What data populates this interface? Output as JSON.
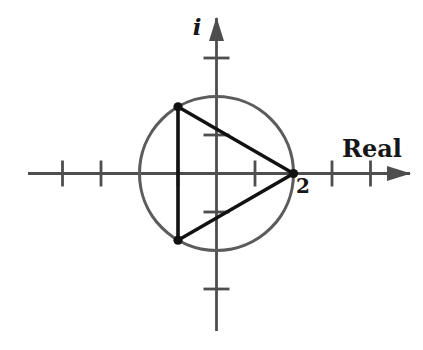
{
  "figure": {
    "background": "#ffffff",
    "colors": {
      "axis": "#4e4e4e",
      "circle": "#5c5c5c",
      "triangle": "#121212",
      "text": "#161616"
    },
    "labels": {
      "imaginary": "i",
      "real": "Real",
      "point": "2"
    },
    "label_positions": {
      "imaginary": {
        "x": 197,
        "y": 35
      },
      "real": {
        "x": 372,
        "y": 157
      },
      "point": {
        "x": 303,
        "y": 193
      }
    },
    "geometry": {
      "origin": {
        "x": 216.5,
        "y": 173.5
      },
      "unit": 38.5,
      "x_axis": {
        "x1": 28,
        "x2": 410
      },
      "y_axis": {
        "y1": 331,
        "y2": 18
      },
      "x_ticks": [
        -4,
        -3,
        -1,
        1,
        3,
        4
      ],
      "y_ticks": [
        -3,
        -1,
        1,
        3
      ],
      "tick_half": 13,
      "arrow_length": 23,
      "arrow_half_width": 7.5,
      "circle_radius_units": 2,
      "triangle_vertices_units": [
        [
          2,
          0
        ],
        [
          -1,
          1.7320508
        ],
        [
          -1,
          -1.7320508
        ]
      ],
      "vertex_dot_radius": 4.6,
      "stroke": {
        "axis": 2.8,
        "circle": 3.1,
        "triangle": 3.6
      }
    }
  }
}
